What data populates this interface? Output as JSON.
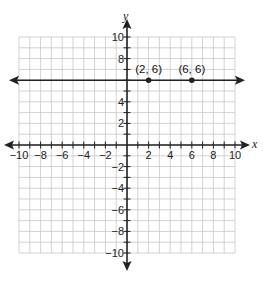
{
  "chart_data": {
    "type": "line",
    "title": "",
    "xlabel": "x",
    "ylabel": "y",
    "xlim": [
      -10,
      10
    ],
    "ylim": [
      -10,
      10
    ],
    "grid": true,
    "grid_step": 1,
    "x_tick_labels": [
      "-10",
      "-8",
      "-6",
      "-4",
      "-2",
      "2",
      "4",
      "6",
      "8",
      "10"
    ],
    "y_tick_labels": [
      "10",
      "8",
      "4",
      "2",
      "-2",
      "-4",
      "-6",
      "-8",
      "-10"
    ],
    "series": [
      {
        "name": "horizontal line y = 6",
        "kind": "line",
        "equation": "y = 6",
        "arrows_both_ends": true,
        "points": [
          {
            "x": 2,
            "y": 6,
            "label": "(2, 6)"
          },
          {
            "x": 6,
            "y": 6,
            "label": "(6, 6)"
          }
        ]
      }
    ],
    "colors": {
      "grid": "#c8c8c8",
      "axes": "#222222",
      "line": "#222222"
    }
  }
}
